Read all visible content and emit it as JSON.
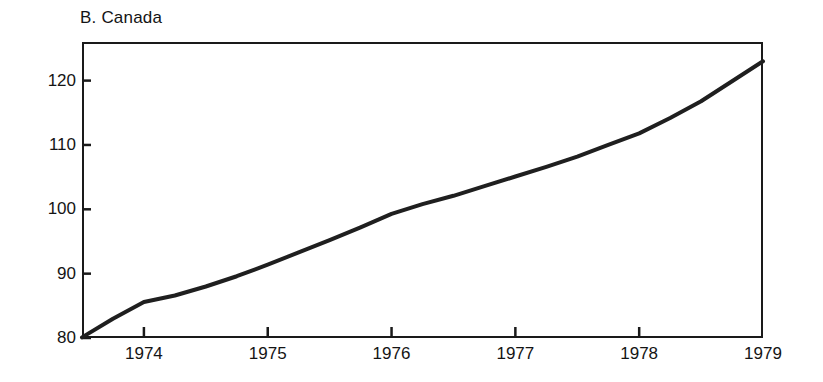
{
  "chart_data": {
    "type": "line",
    "title": "B. Canada",
    "xlabel": "",
    "ylabel": "",
    "grid": false,
    "legend": null,
    "xlim": [
      1973.5,
      1979.0
    ],
    "ylim": [
      80,
      126
    ],
    "xticks": [
      1974,
      1975,
      1976,
      1977,
      1978,
      1979
    ],
    "xtick_labels": [
      "1974",
      "1975",
      "1976",
      "1977",
      "1978",
      "1979"
    ],
    "yticks": [
      80,
      90,
      100,
      110,
      120
    ],
    "ytick_labels": [
      "80",
      "90",
      "100",
      "110",
      "120"
    ],
    "line_color": "#1f1f1f",
    "line_width": 4,
    "series": [
      {
        "name": "Canada index",
        "x": [
          1973.5,
          1973.75,
          1974.0,
          1974.25,
          1974.5,
          1974.75,
          1975.0,
          1975.25,
          1975.5,
          1975.75,
          1976.0,
          1976.25,
          1976.5,
          1976.75,
          1977.0,
          1977.25,
          1977.5,
          1977.75,
          1978.0,
          1978.25,
          1978.5,
          1978.75,
          1979.0
        ],
        "values": [
          80.1,
          83.0,
          85.6,
          86.6,
          88.0,
          89.6,
          91.4,
          93.3,
          95.2,
          97.2,
          99.3,
          100.8,
          102.1,
          103.6,
          105.1,
          106.6,
          108.2,
          110.0,
          111.8,
          114.2,
          116.8,
          119.9,
          123.0
        ]
      }
    ]
  }
}
